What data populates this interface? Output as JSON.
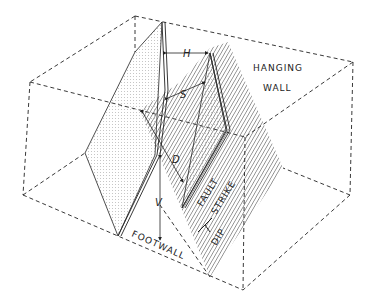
{
  "diagram": {
    "labels": {
      "hanging_wall_1": "HANGING",
      "hanging_wall_2": "WALL",
      "footwall": "FOOTWALL",
      "fault": "FAULT",
      "strike": "STRIKE",
      "dip": "DIP"
    },
    "symbols": {
      "horizontal": "H",
      "slip": "S",
      "dip_separation": "D",
      "vertical": "V"
    },
    "colors": {
      "line": "#222222",
      "background": "#ffffff",
      "dots": "#8a8a8a"
    }
  }
}
